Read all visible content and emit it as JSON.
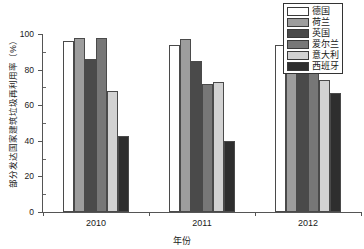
{
  "chart_data": {
    "type": "bar",
    "title": "",
    "xlabel": "年份",
    "ylabel": "部分发达国家建筑垃圾再利用率（%）",
    "categories": [
      "2010",
      "2011",
      "2012"
    ],
    "ylim": [
      0,
      100
    ],
    "yticks": [
      0,
      20,
      40,
      60,
      80,
      100
    ],
    "ytick_labels": [
      "0",
      "20",
      "40",
      "60",
      "80",
      "100"
    ],
    "grid": false,
    "legend_position": "top-right",
    "series": [
      {
        "name": "德国",
        "color": "#ffffff",
        "values": [
          96,
          94,
          94
        ]
      },
      {
        "name": "荷兰",
        "color": "#9d9d9d",
        "values": [
          98,
          97,
          97
        ]
      },
      {
        "name": "英国",
        "color": "#4a4a4a",
        "values": [
          86,
          85,
          86
        ]
      },
      {
        "name": "爱尔兰",
        "color": "#777777",
        "values": [
          98,
          72,
          78
        ]
      },
      {
        "name": "意大利",
        "color": "#d2d2d2",
        "values": [
          68,
          73,
          74
        ]
      },
      {
        "name": "西班牙",
        "color": "#2e2e2e",
        "values": [
          43,
          40,
          67
        ]
      }
    ]
  },
  "legend": {
    "items": [
      {
        "label": "德国",
        "color": "#ffffff"
      },
      {
        "label": "荷兰",
        "color": "#9d9d9d"
      },
      {
        "label": "英国",
        "color": "#4a4a4a"
      },
      {
        "label": "爱尔兰",
        "color": "#777777"
      },
      {
        "label": "意大利",
        "color": "#d2d2d2"
      },
      {
        "label": "西班牙",
        "color": "#2e2e2e"
      }
    ]
  },
  "axes": {
    "x_title": "年份",
    "y_title": "部分发达国家建筑垃圾再利用率（%）",
    "x_categories": [
      "2010",
      "2011",
      "2012"
    ],
    "y_tick_labels": [
      "0",
      "20",
      "40",
      "60",
      "80",
      "100"
    ]
  }
}
